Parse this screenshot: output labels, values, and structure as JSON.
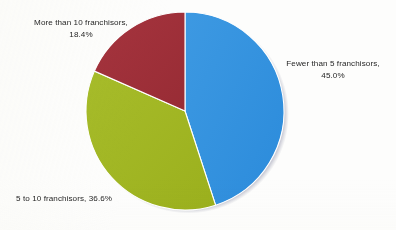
{
  "chart_data": {
    "type": "pie",
    "title": "",
    "subtitle": "",
    "xlabel": "",
    "ylabel": "",
    "legend_position": "none",
    "grid": false,
    "labels_inside": false,
    "start_angle_deg": 0,
    "direction": "clockwise",
    "categories": [
      "Fewer than 5 franchisors",
      "5 to 10 franchisors",
      "More than 10 franchisors"
    ],
    "values": [
      45.0,
      36.6,
      18.4
    ],
    "value_suffix": "%",
    "colors": [
      "#3090dd",
      "#a2b724",
      "#a0303a"
    ],
    "slices": [
      {
        "category": "Fewer than 5 franchisors",
        "value": 45.0,
        "display": "45.0%",
        "color": "#3090dd",
        "label_text": "Fewer than 5 franchisors,",
        "label_value": "45.0%",
        "start_deg": 0,
        "end_deg": 162.0
      },
      {
        "category": "5 to 10 franchisors",
        "value": 36.6,
        "display": "36.6%",
        "color": "#a2b724",
        "label_text": "5 to 10 franchisors, 36.6%",
        "label_value": "",
        "start_deg": 162.0,
        "end_deg": 293.76
      },
      {
        "category": "More than 10 franchisors",
        "value": 18.4,
        "display": "18.4%",
        "color": "#a0303a",
        "label_text": "More than 10 franchisors,",
        "label_value": "18.4%",
        "start_deg": 293.76,
        "end_deg": 360.0
      }
    ]
  },
  "labels": {
    "more_than_10": {
      "line1": "More than 10 franchisors,",
      "line2": "18.4%"
    },
    "fewer_than_5": {
      "line1": "Fewer than 5 franchisors,",
      "line2": "45.0%"
    },
    "five_to_10": {
      "line1": "5 to 10 franchisors, 36.6%"
    }
  },
  "style": {
    "background": "#fdfdfc",
    "text_color": "#272727",
    "slice_border": "#ffffff",
    "shadow_color": "#c9cad3"
  }
}
